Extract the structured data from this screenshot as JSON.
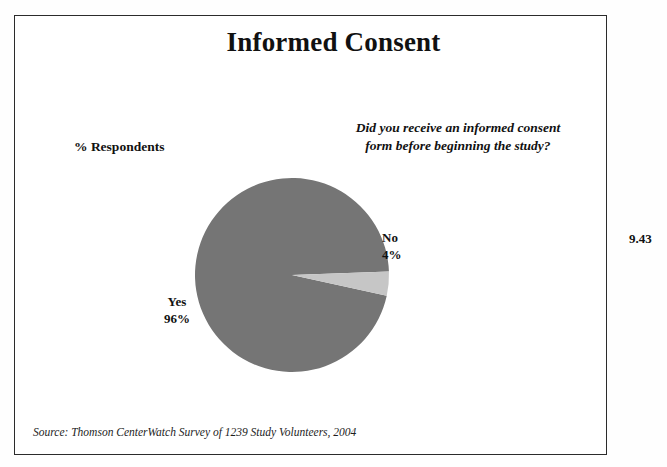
{
  "figure": {
    "number": "9.43"
  },
  "slide": {
    "title": "Informed Consent",
    "axis_label": "% Respondents",
    "question": "Did you receive an informed consent form before beginning the study?",
    "source": "Source: Thomson CenterWatch Survey of 1239 Study Volunteers, 2004"
  },
  "colors": {
    "yes_slice": "#757575",
    "no_slice": "#c6c6c6",
    "border": "#2b2b2b",
    "text": "#111111",
    "background": "#ffffff"
  },
  "chart_data": {
    "type": "pie",
    "title": "Informed Consent",
    "subtitle": "Did you receive an informed consent form before beginning the study?",
    "ylabel": "% Respondents",
    "unit": "%",
    "legend": "none",
    "labels_inline": true,
    "start_angle_deg": -2,
    "direction": "counterclockwise",
    "categories": [
      "Yes",
      "No"
    ],
    "values": [
      96,
      4
    ],
    "slices": [
      {
        "label": "Yes",
        "value": 96,
        "value_text": "96%",
        "color": "#757575"
      },
      {
        "label": "No",
        "value": 4,
        "value_text": "4%",
        "color": "#c6c6c6"
      }
    ],
    "source": "Source: Thomson CenterWatch Survey of 1239 Study Volunteers, 2004"
  }
}
